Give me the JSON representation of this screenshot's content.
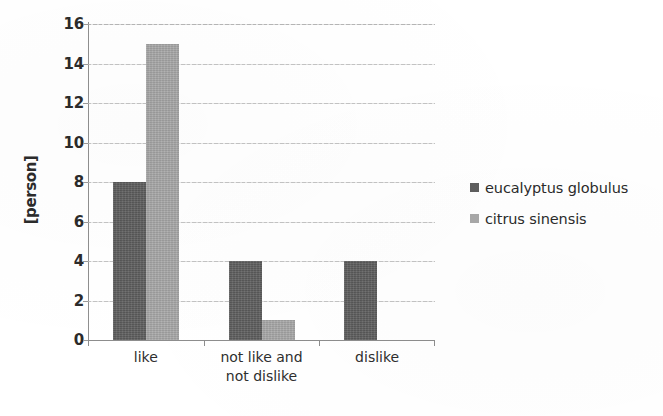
{
  "chart_data": {
    "type": "bar",
    "title": "",
    "xlabel": "",
    "ylabel": "[person]",
    "ylim": [
      0,
      16
    ],
    "ytick_step": 2,
    "yticks": [
      16,
      14,
      12,
      10,
      8,
      6,
      4,
      2,
      0
    ],
    "grid": true,
    "grid_axis": "y",
    "legend_position": "right",
    "categories": [
      "like",
      "not like and\nnot dislike",
      "dislike"
    ],
    "category_lines": [
      [
        "like"
      ],
      [
        "not like and",
        "not dislike"
      ],
      [
        "dislike"
      ]
    ],
    "series": [
      {
        "name": "eucalyptus globulus",
        "color": "#5e5e5e",
        "values": [
          8,
          4,
          4
        ]
      },
      {
        "name": "citrus sinensis",
        "color": "#a8a8a8",
        "values": [
          15,
          1,
          0
        ]
      }
    ]
  },
  "legend": {
    "items": [
      {
        "label": "eucalyptus globulus",
        "color": "#5e5e5e"
      },
      {
        "label": "citrus sinensis",
        "color": "#a8a8a8"
      }
    ]
  },
  "axis": {
    "y_title": "[person]",
    "y_tick_labels": [
      "16",
      "14",
      "12",
      "10",
      "8",
      "6",
      "4",
      "2",
      "0"
    ]
  }
}
